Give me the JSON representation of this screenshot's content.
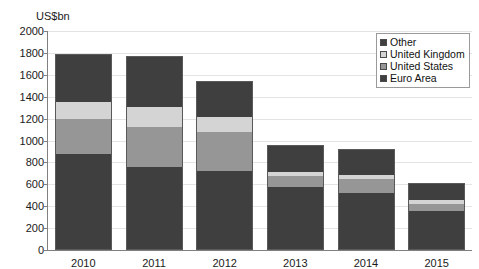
{
  "chart_data": {
    "type": "bar",
    "subtype": "stacked-vertical",
    "title": "",
    "xlabel": "",
    "ylabel": "US$bn",
    "ylim": [
      0,
      2000
    ],
    "yticks": [
      0,
      200,
      400,
      600,
      800,
      1000,
      1200,
      1400,
      1600,
      1800,
      2000
    ],
    "grid": true,
    "legend_position": "top-right",
    "categories": [
      "2010",
      "2011",
      "2012",
      "2013",
      "2014",
      "2015"
    ],
    "stack_order_bottom_to_top": [
      "Euro Area",
      "United States",
      "United Kingdom",
      "Other"
    ],
    "series": [
      {
        "name": "Euro Area",
        "color": "#3f3f3f",
        "values": [
          880,
          760,
          720,
          580,
          520,
          360
        ]
      },
      {
        "name": "United States",
        "color": "#969696",
        "values": [
          320,
          370,
          360,
          100,
          130,
          60
        ]
      },
      {
        "name": "United Kingdom",
        "color": "#d4d4d4",
        "values": [
          160,
          180,
          140,
          40,
          40,
          40
        ]
      },
      {
        "name": "Other",
        "color": "#3f3f3f",
        "values": [
          430,
          460,
          320,
          240,
          230,
          150
        ]
      }
    ],
    "totals": [
      1790,
      1770,
      1540,
      960,
      920,
      610
    ]
  },
  "legend": {
    "items": [
      {
        "label": "Other",
        "swatch": "#3f3f3f"
      },
      {
        "label": "United Kingdom",
        "swatch": "#d4d4d4"
      },
      {
        "label": "United States",
        "swatch": "#969696"
      },
      {
        "label": "Euro Area",
        "swatch": "#3f3f3f"
      }
    ]
  },
  "colors": {
    "axis": "#808080",
    "grid": "#e4e4e4",
    "background": "#ffffff",
    "text": "#1a1a1a",
    "bar_border": "#5a5a5a"
  }
}
